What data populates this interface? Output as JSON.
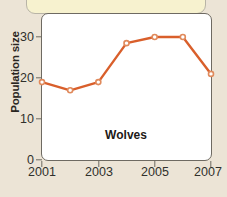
{
  "chart_data": {
    "type": "line",
    "title": "",
    "series_label": "Wolves",
    "xlabel": "",
    "ylabel": "Population size",
    "x": [
      2001,
      2002,
      2003,
      2004,
      2005,
      2006,
      2007
    ],
    "values": [
      19,
      17,
      19,
      28.5,
      30,
      30,
      21
    ],
    "series": [
      {
        "name": "Wolves",
        "values": [
          19,
          17,
          19,
          28.5,
          30,
          30,
          21
        ]
      }
    ],
    "x_tick_labels": [
      "2001",
      "2003",
      "2005",
      "2007"
    ],
    "x_tick_values": [
      2001,
      2003,
      2005,
      2007
    ],
    "y_tick_labels": [
      "0",
      "10",
      "20",
      "30"
    ],
    "y_tick_values": [
      0,
      10,
      20,
      30
    ],
    "xlim": [
      2001,
      2007
    ],
    "ylim": [
      0,
      34
    ],
    "grid": false,
    "legend": "none",
    "marker": "circle-open",
    "line_color": "#d95f2b",
    "marker_color": "#e08a5c",
    "plot_background": "#ffffff",
    "axis_color": "#6e6a62"
  },
  "page": {
    "background_color": "#ece4d6",
    "callout_color": "#f7f2cf",
    "callout_border_color": "#b8b4a6",
    "ghost_lines": [
      "",
      "",
      "",
      "",
      ""
    ]
  }
}
